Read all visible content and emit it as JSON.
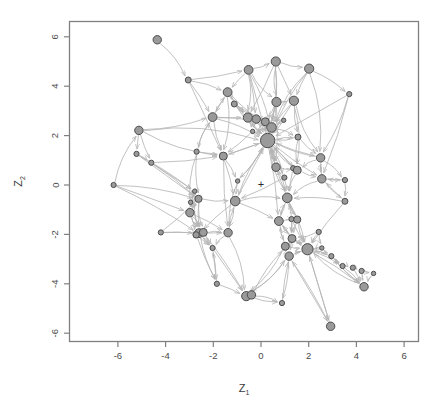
{
  "figure": {
    "title": "",
    "xlabel": "Z",
    "xlabel_sub": "1",
    "ylabel": "Z",
    "ylabel_sub": "2",
    "origin_marker": "+",
    "frame_color": "#808080",
    "node_fill": "#9a9a9a",
    "node_stroke": "#4d4d4d",
    "edge_color": "#b4b4b4",
    "background": "#ffffff"
  },
  "axes": {
    "x_ticks": [
      "-6",
      "-4",
      "-2",
      "0",
      "2",
      "4",
      "6"
    ],
    "y_ticks": [
      "6",
      "4",
      "2",
      "0",
      "-2",
      "-4",
      "-6"
    ],
    "x_tick_values": [
      -6,
      -4,
      -2,
      0,
      2,
      4,
      6
    ],
    "y_tick_values": [
      6,
      4,
      2,
      0,
      -2,
      -4,
      -6
    ],
    "xlim": [
      -7.9,
      6.6
    ],
    "ylim": [
      -6.6,
      6.8
    ]
  },
  "chart_data": {
    "type": "scatter",
    "title": "",
    "xlabel": "Z1",
    "ylabel": "Z2",
    "xlim": [
      -7.9,
      6.6
    ],
    "ylim": [
      -6.6,
      6.8
    ],
    "grid": false,
    "legend": null,
    "origin": [
      0,
      0
    ],
    "nodes": [
      {
        "id": 0,
        "x": -4.35,
        "y": 5.88,
        "r": 4.2
      },
      {
        "id": 1,
        "x": -3.05,
        "y": 4.25,
        "r": 3.0
      },
      {
        "id": 2,
        "x": -0.52,
        "y": 4.66,
        "r": 4.4
      },
      {
        "id": 3,
        "x": 0.62,
        "y": 5.0,
        "r": 4.6
      },
      {
        "id": 4,
        "x": 2.02,
        "y": 4.71,
        "r": 4.6
      },
      {
        "id": 5,
        "x": -1.4,
        "y": 3.76,
        "r": 4.4
      },
      {
        "id": 6,
        "x": -1.12,
        "y": 3.28,
        "r": 3.0
      },
      {
        "id": 7,
        "x": 0.65,
        "y": 3.36,
        "r": 4.6
      },
      {
        "id": 8,
        "x": 1.38,
        "y": 3.41,
        "r": 4.6
      },
      {
        "id": 9,
        "x": 3.7,
        "y": 3.68,
        "r": 2.6
      },
      {
        "id": 10,
        "x": -2.03,
        "y": 2.75,
        "r": 4.4
      },
      {
        "id": 11,
        "x": -0.55,
        "y": 2.73,
        "r": 4.6
      },
      {
        "id": 12,
        "x": -0.2,
        "y": 2.67,
        "r": 4.2
      },
      {
        "id": 13,
        "x": 0.18,
        "y": 2.56,
        "r": 4.0
      },
      {
        "id": 14,
        "x": 0.95,
        "y": 2.62,
        "r": 2.2
      },
      {
        "id": 15,
        "x": 0.44,
        "y": 2.33,
        "r": 4.8
      },
      {
        "id": 16,
        "x": -0.35,
        "y": 2.17,
        "r": 2.2
      },
      {
        "id": 17,
        "x": -5.12,
        "y": 2.21,
        "r": 4.2
      },
      {
        "id": 18,
        "x": 0.28,
        "y": 1.8,
        "r": 7.2
      },
      {
        "id": 19,
        "x": 1.55,
        "y": 1.94,
        "r": 3.0
      },
      {
        "id": 20,
        "x": -5.22,
        "y": 1.26,
        "r": 2.6
      },
      {
        "id": 21,
        "x": -2.7,
        "y": 1.35,
        "r": 2.6
      },
      {
        "id": 22,
        "x": -1.58,
        "y": 1.17,
        "r": 4.0
      },
      {
        "id": 23,
        "x": 2.5,
        "y": 1.1,
        "r": 4.2
      },
      {
        "id": 24,
        "x": -4.6,
        "y": 0.9,
        "r": 2.6
      },
      {
        "id": 25,
        "x": 0.63,
        "y": 0.72,
        "r": 4.2
      },
      {
        "id": 26,
        "x": 1.35,
        "y": 0.68,
        "r": 2.6
      },
      {
        "id": 27,
        "x": 1.52,
        "y": 0.6,
        "r": 4.0
      },
      {
        "id": 28,
        "x": 0.98,
        "y": 0.3,
        "r": 2.6
      },
      {
        "id": 29,
        "x": -0.98,
        "y": 0.16,
        "r": 2.2
      },
      {
        "id": 30,
        "x": -6.18,
        "y": 0.0,
        "r": 2.6
      },
      {
        "id": 31,
        "x": 2.55,
        "y": 0.25,
        "r": 4.2
      },
      {
        "id": 32,
        "x": 3.52,
        "y": 0.2,
        "r": 2.6
      },
      {
        "id": 33,
        "x": -2.78,
        "y": -0.25,
        "r": 2.2
      },
      {
        "id": 34,
        "x": -2.95,
        "y": -0.7,
        "r": 2.2
      },
      {
        "id": 35,
        "x": -2.62,
        "y": -0.56,
        "r": 3.6
      },
      {
        "id": 36,
        "x": -1.08,
        "y": -0.65,
        "r": 4.8
      },
      {
        "id": 37,
        "x": 1.1,
        "y": -0.52,
        "r": 4.8
      },
      {
        "id": 38,
        "x": 3.52,
        "y": -0.66,
        "r": 3.0
      },
      {
        "id": 39,
        "x": -2.98,
        "y": -1.12,
        "r": 4.2
      },
      {
        "id": 40,
        "x": 0.75,
        "y": -1.46,
        "r": 4.4
      },
      {
        "id": 41,
        "x": 1.28,
        "y": -1.38,
        "r": 2.6
      },
      {
        "id": 42,
        "x": 1.52,
        "y": -1.4,
        "r": 3.6
      },
      {
        "id": 43,
        "x": -2.6,
        "y": -1.95,
        "r": 4.4
      },
      {
        "id": 44,
        "x": -2.42,
        "y": -1.92,
        "r": 4.0
      },
      {
        "id": 45,
        "x": -2.72,
        "y": -2.02,
        "r": 3.2
      },
      {
        "id": 46,
        "x": -1.38,
        "y": -1.93,
        "r": 4.2
      },
      {
        "id": 47,
        "x": -4.2,
        "y": -1.92,
        "r": 2.6
      },
      {
        "id": 48,
        "x": 2.42,
        "y": -1.9,
        "r": 2.6
      },
      {
        "id": 49,
        "x": 1.3,
        "y": -2.17,
        "r": 4.0
      },
      {
        "id": 50,
        "x": 1.02,
        "y": -2.48,
        "r": 4.0
      },
      {
        "id": 51,
        "x": -2.03,
        "y": -2.55,
        "r": 2.6
      },
      {
        "id": 52,
        "x": 1.95,
        "y": -2.6,
        "r": 5.6
      },
      {
        "id": 53,
        "x": 2.55,
        "y": -2.55,
        "r": 2.2
      },
      {
        "id": 54,
        "x": 1.18,
        "y": -2.88,
        "r": 4.2
      },
      {
        "id": 55,
        "x": 2.95,
        "y": -2.88,
        "r": 2.6
      },
      {
        "id": 56,
        "x": 3.42,
        "y": -3.28,
        "r": 2.6
      },
      {
        "id": 57,
        "x": 3.85,
        "y": -3.35,
        "r": 2.6
      },
      {
        "id": 58,
        "x": 4.22,
        "y": -3.48,
        "r": 2.6
      },
      {
        "id": 59,
        "x": 4.72,
        "y": -3.58,
        "r": 2.2
      },
      {
        "id": 60,
        "x": 4.32,
        "y": -4.12,
        "r": 4.2
      },
      {
        "id": 61,
        "x": -1.85,
        "y": -4.0,
        "r": 2.6
      },
      {
        "id": 62,
        "x": -0.62,
        "y": -4.5,
        "r": 4.6
      },
      {
        "id": 63,
        "x": -0.4,
        "y": -4.45,
        "r": 4.2
      },
      {
        "id": 64,
        "x": 0.88,
        "y": -4.78,
        "r": 2.6
      },
      {
        "id": 65,
        "x": 2.92,
        "y": -5.72,
        "r": 4.2
      }
    ],
    "edges": [
      [
        0,
        1
      ],
      [
        1,
        5
      ],
      [
        1,
        10
      ],
      [
        1,
        22
      ],
      [
        1,
        2
      ],
      [
        2,
        3
      ],
      [
        2,
        7
      ],
      [
        2,
        11
      ],
      [
        2,
        15
      ],
      [
        2,
        12
      ],
      [
        2,
        18
      ],
      [
        2,
        5
      ],
      [
        3,
        4
      ],
      [
        3,
        7
      ],
      [
        3,
        18
      ],
      [
        3,
        15
      ],
      [
        3,
        11
      ],
      [
        3,
        8
      ],
      [
        4,
        8
      ],
      [
        4,
        18
      ],
      [
        4,
        15
      ],
      [
        4,
        23
      ],
      [
        4,
        9
      ],
      [
        5,
        6
      ],
      [
        5,
        10
      ],
      [
        5,
        11
      ],
      [
        5,
        15
      ],
      [
        5,
        18
      ],
      [
        5,
        22
      ],
      [
        6,
        11
      ],
      [
        6,
        15
      ],
      [
        6,
        18
      ],
      [
        6,
        12
      ],
      [
        7,
        8
      ],
      [
        7,
        15
      ],
      [
        7,
        18
      ],
      [
        7,
        13
      ],
      [
        7,
        25
      ],
      [
        8,
        18
      ],
      [
        8,
        15
      ],
      [
        8,
        19
      ],
      [
        8,
        23
      ],
      [
        8,
        27
      ],
      [
        9,
        23
      ],
      [
        9,
        31
      ],
      [
        9,
        18
      ],
      [
        10,
        11
      ],
      [
        10,
        22
      ],
      [
        10,
        21
      ],
      [
        10,
        15
      ],
      [
        10,
        18
      ],
      [
        10,
        5
      ],
      [
        11,
        12
      ],
      [
        11,
        13
      ],
      [
        11,
        15
      ],
      [
        11,
        18
      ],
      [
        11,
        16
      ],
      [
        12,
        13
      ],
      [
        12,
        15
      ],
      [
        12,
        18
      ],
      [
        12,
        16
      ],
      [
        13,
        15
      ],
      [
        13,
        18
      ],
      [
        13,
        14
      ],
      [
        13,
        25
      ],
      [
        14,
        18
      ],
      [
        14,
        15
      ],
      [
        15,
        18
      ],
      [
        15,
        16
      ],
      [
        15,
        25
      ],
      [
        15,
        19
      ],
      [
        16,
        18
      ],
      [
        16,
        22
      ],
      [
        17,
        20
      ],
      [
        17,
        24
      ],
      [
        17,
        10
      ],
      [
        17,
        22
      ],
      [
        17,
        18
      ],
      [
        18,
        19
      ],
      [
        18,
        25
      ],
      [
        18,
        27
      ],
      [
        18,
        23
      ],
      [
        18,
        36
      ],
      [
        18,
        37
      ],
      [
        18,
        28
      ],
      [
        18,
        29
      ],
      [
        18,
        40
      ],
      [
        18,
        22
      ],
      [
        18,
        31
      ],
      [
        19,
        23
      ],
      [
        19,
        27
      ],
      [
        19,
        18
      ],
      [
        20,
        24
      ],
      [
        20,
        33
      ],
      [
        20,
        35
      ],
      [
        21,
        22
      ],
      [
        21,
        35
      ],
      [
        21,
        39
      ],
      [
        21,
        10
      ],
      [
        22,
        29
      ],
      [
        22,
        36
      ],
      [
        22,
        18
      ],
      [
        22,
        46
      ],
      [
        23,
        31
      ],
      [
        23,
        27
      ],
      [
        23,
        32
      ],
      [
        23,
        18
      ],
      [
        24,
        35
      ],
      [
        24,
        33
      ],
      [
        24,
        22
      ],
      [
        25,
        27
      ],
      [
        25,
        28
      ],
      [
        25,
        37
      ],
      [
        25,
        18
      ],
      [
        26,
        27
      ],
      [
        26,
        37
      ],
      [
        26,
        18
      ],
      [
        27,
        31
      ],
      [
        27,
        37
      ],
      [
        27,
        18
      ],
      [
        28,
        37
      ],
      [
        28,
        36
      ],
      [
        28,
        18
      ],
      [
        29,
        36
      ],
      [
        29,
        18
      ],
      [
        29,
        46
      ],
      [
        30,
        17
      ],
      [
        30,
        35
      ],
      [
        30,
        43
      ],
      [
        30,
        39
      ],
      [
        31,
        32
      ],
      [
        31,
        38
      ],
      [
        31,
        37
      ],
      [
        31,
        23
      ],
      [
        32,
        38
      ],
      [
        32,
        31
      ],
      [
        33,
        34
      ],
      [
        33,
        35
      ],
      [
        33,
        39
      ],
      [
        33,
        43
      ],
      [
        34,
        35
      ],
      [
        34,
        39
      ],
      [
        34,
        43
      ],
      [
        35,
        39
      ],
      [
        35,
        43
      ],
      [
        35,
        36
      ],
      [
        35,
        44
      ],
      [
        36,
        37
      ],
      [
        36,
        46
      ],
      [
        36,
        40
      ],
      [
        36,
        18
      ],
      [
        36,
        43
      ],
      [
        37,
        40
      ],
      [
        37,
        42
      ],
      [
        37,
        49
      ],
      [
        37,
        52
      ],
      [
        37,
        18
      ],
      [
        38,
        31
      ],
      [
        38,
        52
      ],
      [
        38,
        37
      ],
      [
        39,
        43
      ],
      [
        39,
        44
      ],
      [
        39,
        45
      ],
      [
        39,
        46
      ],
      [
        39,
        35
      ],
      [
        40,
        49
      ],
      [
        40,
        50
      ],
      [
        40,
        52
      ],
      [
        40,
        42
      ],
      [
        40,
        37
      ],
      [
        41,
        42
      ],
      [
        41,
        49
      ],
      [
        41,
        52
      ],
      [
        42,
        49
      ],
      [
        42,
        52
      ],
      [
        42,
        37
      ],
      [
        43,
        44
      ],
      [
        43,
        45
      ],
      [
        43,
        46
      ],
      [
        43,
        51
      ],
      [
        43,
        61
      ],
      [
        44,
        45
      ],
      [
        44,
        46
      ],
      [
        44,
        51
      ],
      [
        44,
        62
      ],
      [
        45,
        51
      ],
      [
        45,
        61
      ],
      [
        45,
        43
      ],
      [
        46,
        51
      ],
      [
        46,
        62
      ],
      [
        46,
        36
      ],
      [
        47,
        43
      ],
      [
        47,
        44
      ],
      [
        47,
        35
      ],
      [
        48,
        52
      ],
      [
        48,
        53
      ],
      [
        48,
        49
      ],
      [
        49,
        50
      ],
      [
        49,
        52
      ],
      [
        49,
        54
      ],
      [
        49,
        40
      ],
      [
        50,
        52
      ],
      [
        50,
        54
      ],
      [
        50,
        62
      ],
      [
        50,
        40
      ],
      [
        51,
        61
      ],
      [
        51,
        62
      ],
      [
        51,
        43
      ],
      [
        52,
        53
      ],
      [
        52,
        54
      ],
      [
        52,
        55
      ],
      [
        52,
        56
      ],
      [
        52,
        60
      ],
      [
        52,
        65
      ],
      [
        52,
        49
      ],
      [
        53,
        55
      ],
      [
        53,
        52
      ],
      [
        54,
        62
      ],
      [
        54,
        64
      ],
      [
        54,
        52
      ],
      [
        54,
        65
      ],
      [
        55,
        56
      ],
      [
        55,
        60
      ],
      [
        55,
        52
      ],
      [
        56,
        57
      ],
      [
        56,
        60
      ],
      [
        57,
        58
      ],
      [
        57,
        60
      ],
      [
        58,
        59
      ],
      [
        58,
        60
      ],
      [
        59,
        60
      ],
      [
        60,
        52
      ],
      [
        60,
        55
      ],
      [
        61,
        62
      ],
      [
        61,
        51
      ],
      [
        62,
        63
      ],
      [
        62,
        64
      ],
      [
        62,
        54
      ],
      [
        63,
        64
      ],
      [
        63,
        50
      ],
      [
        64,
        54
      ],
      [
        65,
        52
      ],
      [
        65,
        54
      ]
    ]
  }
}
